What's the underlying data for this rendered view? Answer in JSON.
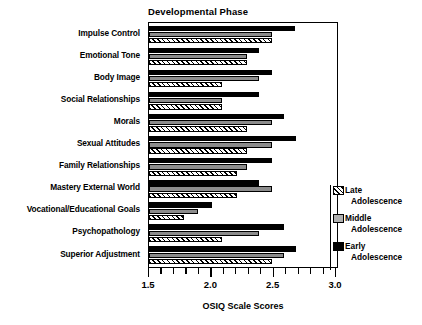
{
  "chart_data": {
    "type": "bar",
    "orientation": "horizontal",
    "title": "Developmental Phase",
    "xlabel": "OSIQ Scale Scores",
    "ylabel": "",
    "xlim": [
      1.5,
      3.0
    ],
    "grid": false,
    "legend_position": "right",
    "xticks": [
      1.5,
      2.0,
      2.5,
      3.0
    ],
    "xticklabels": [
      "1.5",
      "2.0",
      "2.5",
      "3.0"
    ],
    "minor_tick_step": 0.1,
    "categories": [
      "Impulse Control",
      "Emotional Tone",
      "Body Image",
      "Social Relationships",
      "Morals",
      "Sexual Attitudes",
      "Family Relationships",
      "Mastery External World",
      "Vocational/Educational Goals",
      "Psychopathology",
      "Superior Adjustment"
    ],
    "series": [
      {
        "name": "Early Adolescence",
        "legend_line1": "Early",
        "legend_line2": "Adolescence",
        "color": "#000000",
        "fill": "solid-black",
        "values": [
          2.67,
          2.38,
          2.48,
          2.38,
          2.58,
          2.68,
          2.48,
          2.38,
          2.0,
          2.58,
          2.68
        ]
      },
      {
        "name": "Middle Adolescence",
        "legend_line1": "Middle",
        "legend_line2": "Adolescence",
        "color": "#8c8c8c",
        "fill": "solid-gray",
        "values": [
          2.48,
          2.28,
          2.38,
          2.08,
          2.48,
          2.48,
          2.28,
          2.48,
          1.89,
          2.38,
          2.58
        ]
      },
      {
        "name": "Late Adolescence",
        "legend_line1": "Late",
        "legend_line2": "Adolescence",
        "color": "#ffffff",
        "fill": "diagonal-hatch",
        "values": [
          2.48,
          2.28,
          2.08,
          2.08,
          2.28,
          2.28,
          2.2,
          2.2,
          1.78,
          2.08,
          2.48
        ]
      }
    ]
  }
}
